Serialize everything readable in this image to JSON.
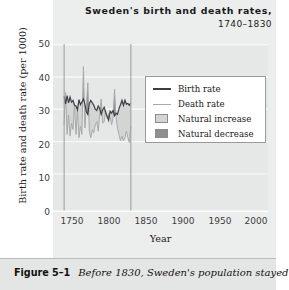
{
  "figure": {
    "number": "Figure 5–1",
    "caption": "Before 1830, Sweden's population stayed"
  },
  "chart_data": {
    "type": "area",
    "title": "Sweden's birth and death rates,",
    "subtitle": "1740–1830",
    "xlabel": "Year",
    "ylabel": "Birth rate and death rate (per 1000)",
    "xlim": [
      1725,
      2015
    ],
    "ylim": [
      0,
      52
    ],
    "xticks": [
      "1750",
      "1800",
      "1850",
      "1900",
      "1950",
      "2000"
    ],
    "xtick_values": [
      1750,
      1800,
      1850,
      1900,
      1950,
      2000
    ],
    "yticks": [
      "0",
      "10",
      "20",
      "30",
      "40",
      "50"
    ],
    "ytick_values": [
      0,
      10,
      20,
      30,
      40,
      50
    ],
    "grid": "horizontal",
    "legend_position": "upper-right",
    "data_range_markers": [
      1740,
      1830
    ],
    "legend": [
      {
        "label": "Birth rate",
        "kind": "line",
        "color": "#3b3f44"
      },
      {
        "label": "Death rate",
        "kind": "line",
        "color": "#a7aaac"
      },
      {
        "label": "Natural increase",
        "kind": "area",
        "color": "#d3d5d2"
      },
      {
        "label": "Natural decrease",
        "kind": "area",
        "color": "#8c9093"
      }
    ],
    "x": [
      1740,
      1742,
      1744,
      1746,
      1748,
      1750,
      1752,
      1754,
      1756,
      1758,
      1760,
      1762,
      1764,
      1766,
      1768,
      1770,
      1772,
      1774,
      1776,
      1778,
      1780,
      1782,
      1784,
      1786,
      1788,
      1790,
      1792,
      1794,
      1796,
      1798,
      1800,
      1802,
      1804,
      1806,
      1808,
      1810,
      1812,
      1814,
      1816,
      1818,
      1820,
      1822,
      1824,
      1826,
      1828,
      1830
    ],
    "series": [
      {
        "name": "Birth rate",
        "color": "#3b3f44",
        "values": [
          35.8,
          33.5,
          36.0,
          33.8,
          35.6,
          34.0,
          34.5,
          33.0,
          32.8,
          31.6,
          34.8,
          33.2,
          34.0,
          35.0,
          33.4,
          31.0,
          30.2,
          33.6,
          34.5,
          33.8,
          33.0,
          31.8,
          31.4,
          32.8,
          32.0,
          30.2,
          31.6,
          32.4,
          30.8,
          29.6,
          28.4,
          31.2,
          30.6,
          31.4,
          29.8,
          30.6,
          30.2,
          32.0,
          33.2,
          34.6,
          33.0,
          34.6,
          33.4,
          33.6,
          33.0,
          33.8
        ]
      },
      {
        "name": "Death rate",
        "color": "#a7aaac",
        "values": [
          27.0,
          37.0,
          24.0,
          30.0,
          23.5,
          27.5,
          25.5,
          33.5,
          24.0,
          31.5,
          23.0,
          26.5,
          24.0,
          45.0,
          26.0,
          33.0,
          40.0,
          25.0,
          23.0,
          25.5,
          24.5,
          27.0,
          28.0,
          25.0,
          30.0,
          35.0,
          27.5,
          28.0,
          31.5,
          29.0,
          30.5,
          29.5,
          27.0,
          29.0,
          38.0,
          29.5,
          26.0,
          24.0,
          22.0,
          23.5,
          22.0,
          23.0,
          25.0,
          23.0,
          21.5,
          26.5
        ]
      }
    ]
  }
}
